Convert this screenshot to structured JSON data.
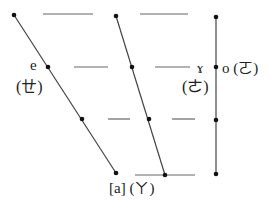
{
  "diagram": {
    "type": "vowel-tongue-position-diagram",
    "colors": {
      "line": "#444444",
      "dash": "#666666",
      "dot": "#111111",
      "text": "#222222"
    },
    "lines": [
      {
        "name": "front-vowel-line",
        "from": [
          14,
          15
        ],
        "to": [
          116,
          173
        ],
        "dots": [
          [
            14,
            15
          ],
          [
            48,
            67
          ],
          [
            82,
            119
          ],
          [
            116,
            173
          ]
        ]
      },
      {
        "name": "central-vowel-line",
        "from": [
          116,
          16
        ],
        "to": [
          165,
          175
        ],
        "dots": [
          [
            116,
            16
          ],
          [
            132,
            67
          ],
          [
            149,
            119
          ],
          [
            165,
            175
          ]
        ]
      },
      {
        "name": "back-vowel-line",
        "from": [
          216,
          17
        ],
        "to": [
          216,
          174
        ],
        "dots": [
          [
            216,
            17
          ],
          [
            216,
            67
          ],
          [
            216,
            120
          ],
          [
            216,
            174
          ]
        ]
      }
    ],
    "dashes": [
      {
        "x1": 43,
        "x2": 93,
        "y": 14
      },
      {
        "x1": 140,
        "x2": 188,
        "y": 14
      },
      {
        "x1": 74,
        "x2": 108,
        "y": 67
      },
      {
        "x1": 155,
        "x2": 190,
        "y": 67
      },
      {
        "x1": 108,
        "x2": 130,
        "y": 119
      },
      {
        "x1": 172,
        "x2": 195,
        "y": 119
      },
      {
        "x1": 135,
        "x2": 195,
        "y": 175
      }
    ],
    "labels": {
      "e_symbol": "e",
      "e_zhuyin": "(ㄝ)",
      "gamma_symbol": "ɤ",
      "gamma_zhuyin": "(ㄜ)",
      "o_label": "o (ㄛ)",
      "a_label": "[a] (ㄚ)"
    }
  }
}
